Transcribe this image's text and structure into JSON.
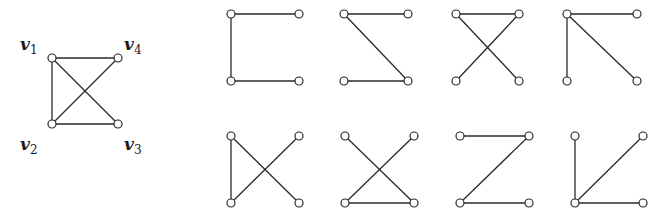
{
  "main_graph": {
    "vertices": [
      {
        "id": "v1",
        "label": "v",
        "sub": "1",
        "x": 52,
        "y": 58,
        "lx": 20,
        "ly": 34
      },
      {
        "id": "v4",
        "label": "v",
        "sub": "4",
        "x": 118,
        "y": 58,
        "lx": 124,
        "ly": 34
      },
      {
        "id": "v2",
        "label": "v",
        "sub": "2",
        "x": 52,
        "y": 124,
        "lx": 20,
        "ly": 134
      },
      {
        "id": "v3",
        "label": "v",
        "sub": "3",
        "x": 118,
        "y": 124,
        "lx": 124,
        "ly": 134
      }
    ],
    "edges": [
      [
        "v1",
        "v4"
      ],
      [
        "v1",
        "v2"
      ],
      [
        "v1",
        "v3"
      ],
      [
        "v2",
        "v4"
      ],
      [
        "v2",
        "v3"
      ]
    ]
  },
  "spanning_trees": [
    {
      "x0": 231,
      "y0": 14,
      "w": 68,
      "h": 67,
      "edges": [
        [
          "TL",
          "TR"
        ],
        [
          "TL",
          "BL"
        ],
        [
          "BL",
          "BR"
        ]
      ]
    },
    {
      "x0": 344,
      "y0": 14,
      "w": 64,
      "h": 67,
      "edges": [
        [
          "TL",
          "TR"
        ],
        [
          "TL",
          "BR"
        ],
        [
          "BL",
          "BR"
        ]
      ]
    },
    {
      "x0": 456,
      "y0": 14,
      "w": 63,
      "h": 67,
      "edges": [
        [
          "TL",
          "TR"
        ],
        [
          "TL",
          "BR"
        ],
        [
          "TR",
          "BL"
        ]
      ]
    },
    {
      "x0": 567,
      "y0": 14,
      "w": 70,
      "h": 67,
      "edges": [
        [
          "TL",
          "TR"
        ],
        [
          "TL",
          "BL"
        ],
        [
          "TL",
          "BR"
        ]
      ]
    },
    {
      "x0": 231,
      "y0": 136,
      "w": 68,
      "h": 67,
      "edges": [
        [
          "TL",
          "BL"
        ],
        [
          "TL",
          "BR"
        ],
        [
          "TR",
          "BL"
        ]
      ]
    },
    {
      "x0": 345,
      "y0": 136,
      "w": 69,
      "h": 67,
      "edges": [
        [
          "TL",
          "BR"
        ],
        [
          "TR",
          "BL"
        ],
        [
          "BL",
          "BR"
        ]
      ]
    },
    {
      "x0": 460,
      "y0": 136,
      "w": 69,
      "h": 67,
      "edges": [
        [
          "TL",
          "TR"
        ],
        [
          "TR",
          "BL"
        ],
        [
          "BL",
          "BR"
        ]
      ]
    },
    {
      "x0": 575,
      "y0": 136,
      "w": 68,
      "h": 67,
      "edges": [
        [
          "TL",
          "BL"
        ],
        [
          "BL",
          "TR"
        ],
        [
          "BL",
          "BR"
        ]
      ]
    }
  ]
}
